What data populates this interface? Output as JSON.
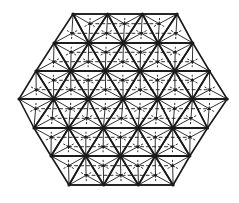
{
  "diagram": {
    "title": "",
    "type": "hexagonal triangular lattice with barycentric subdivision",
    "colors": {
      "stroke": "#1a1a1a",
      "background": "#ffffff"
    },
    "geometry": {
      "rows_y": [
        14,
        43,
        71,
        99,
        128,
        156,
        185
      ],
      "row_left_x": [
        73,
        54,
        36,
        19,
        34,
        51,
        69
      ],
      "row_counts": [
        4,
        5,
        6,
        7,
        6,
        5,
        4
      ],
      "unit_width": 34.7
    },
    "styles": {
      "main_stroke_width": 1.6,
      "sub_stroke_width": 0.9,
      "dash_pattern": "3,3"
    }
  }
}
